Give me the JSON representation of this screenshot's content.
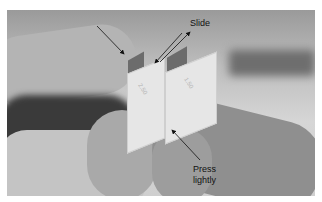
{
  "figure": {
    "annotations": [
      {
        "id": "slide",
        "text": "Slide"
      },
      {
        "id": "press",
        "lines": [
          "Press",
          "lightly"
        ]
      }
    ],
    "block_markings": [
      "2.50",
      "1.50"
    ],
    "colors": {
      "page_bg": "#ffffff",
      "arrow": "#111111",
      "label": "#111111"
    }
  }
}
